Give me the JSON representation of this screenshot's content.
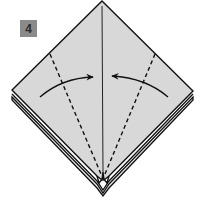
{
  "step": {
    "number": "4",
    "badge_color": "#8a8a8a",
    "badge_text_color": "#2a2a2a"
  },
  "colors": {
    "paper": "#d8d8d8",
    "outline": "#111111",
    "background": "#ffffff"
  },
  "diagram": {
    "elements": [
      {
        "type": "diamond",
        "label": "paper-top-layer"
      },
      {
        "type": "layered-edges",
        "label": "lower-layers"
      },
      {
        "type": "solid-line",
        "label": "center-crease"
      },
      {
        "type": "dashed-line",
        "label": "left-valley-fold"
      },
      {
        "type": "dashed-line",
        "label": "right-valley-fold"
      },
      {
        "type": "curved-arrow",
        "label": "left-fold-arrow",
        "direction": "toward-center"
      },
      {
        "type": "curved-arrow",
        "label": "right-fold-arrow",
        "direction": "toward-center"
      }
    ]
  }
}
